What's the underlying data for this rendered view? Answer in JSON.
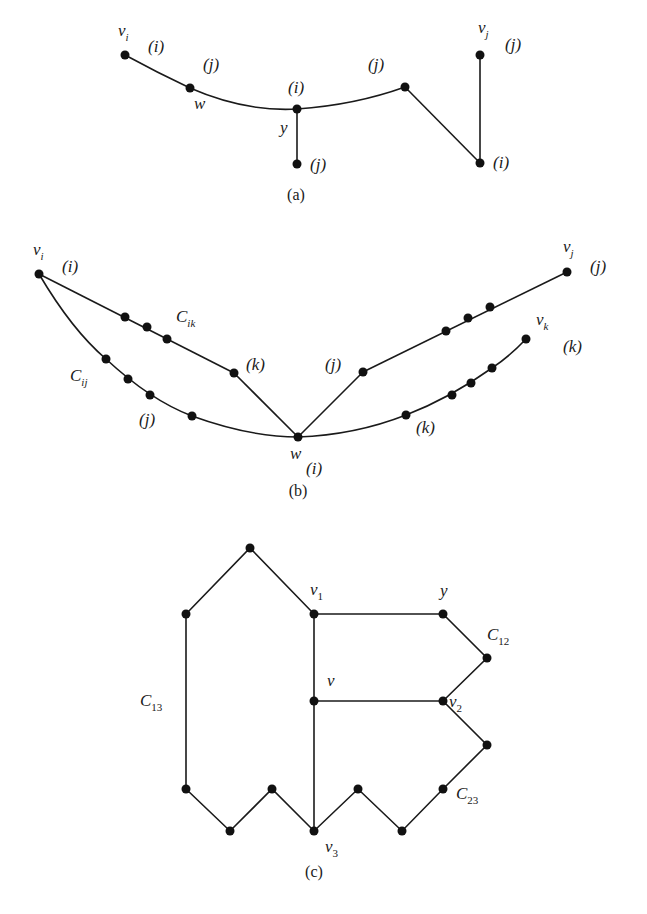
{
  "figure": {
    "style": {
      "ink": "#1a1a1a",
      "node": "#111111",
      "background": "#ffffff",
      "node_radius": 4.5
    },
    "panels": [
      {
        "id": "a",
        "caption": "(a)",
        "caption_pos": [
          296,
          200
        ],
        "nodes": [
          {
            "id": "vi",
            "x": 125,
            "y": 55
          },
          {
            "id": "w",
            "x": 190,
            "y": 88
          },
          {
            "id": "y",
            "x": 297,
            "y": 109
          },
          {
            "id": "yb",
            "x": 297,
            "y": 164
          },
          {
            "id": "pj",
            "x": 405,
            "y": 87
          },
          {
            "id": "pi",
            "x": 480,
            "y": 163
          },
          {
            "id": "vj",
            "x": 480,
            "y": 55
          }
        ],
        "edges": [
          {
            "d": "M125,55 Q158,73 190,88"
          },
          {
            "d": "M190,88 Q245,112 297,109"
          },
          {
            "d": "M297,109 Q355,105 405,87"
          },
          {
            "d": "M297,109 L297,164"
          },
          {
            "d": "M405,87 L480,163"
          },
          {
            "d": "M480,163 L480,55"
          }
        ],
        "labels": [
          {
            "text": "v",
            "sub": "i",
            "x": 118,
            "y": 36
          },
          {
            "text": "(i)",
            "x": 148,
            "y": 52,
            "size": "small"
          },
          {
            "text": "(j)",
            "x": 203,
            "y": 70
          },
          {
            "text": "w",
            "x": 194,
            "y": 109
          },
          {
            "text": "(i)",
            "x": 288,
            "y": 93,
            "size": "small"
          },
          {
            "text": "y",
            "x": 280,
            "y": 133
          },
          {
            "text": "(j)",
            "x": 310,
            "y": 170
          },
          {
            "text": "(j)",
            "x": 368,
            "y": 70
          },
          {
            "text": "v",
            "sub": "j",
            "x": 478,
            "y": 33
          },
          {
            "text": "(j)",
            "x": 505,
            "y": 50
          },
          {
            "text": "(i)",
            "x": 493,
            "y": 168,
            "size": "small"
          }
        ]
      },
      {
        "id": "b",
        "caption": "(b)",
        "caption_pos": [
          298,
          496
        ],
        "nodes": [
          {
            "id": "vi",
            "x": 39,
            "y": 274
          },
          {
            "id": "cik1",
            "x": 125,
            "y": 317
          },
          {
            "id": "cik2",
            "x": 147,
            "y": 327
          },
          {
            "id": "cik3",
            "x": 167,
            "y": 339
          },
          {
            "id": "pk",
            "x": 234,
            "y": 373
          },
          {
            "id": "cij1",
            "x": 106,
            "y": 359
          },
          {
            "id": "cij2",
            "x": 128,
            "y": 379
          },
          {
            "id": "cij3",
            "x": 150,
            "y": 395
          },
          {
            "id": "cij4",
            "x": 192,
            "y": 416
          },
          {
            "id": "w",
            "x": 298,
            "y": 437
          },
          {
            "id": "pj",
            "x": 363,
            "y": 372
          },
          {
            "id": "j1",
            "x": 446,
            "y": 331
          },
          {
            "id": "j2",
            "x": 468,
            "y": 318
          },
          {
            "id": "j3",
            "x": 490,
            "y": 307
          },
          {
            "id": "vj",
            "x": 567,
            "y": 272
          },
          {
            "id": "pk2",
            "x": 406,
            "y": 415
          },
          {
            "id": "k1",
            "x": 452,
            "y": 395
          },
          {
            "id": "k2",
            "x": 471,
            "y": 383
          },
          {
            "id": "k3",
            "x": 492,
            "y": 368
          },
          {
            "id": "vk",
            "x": 526,
            "y": 339
          }
        ],
        "edges": [
          {
            "d": "M39,274 L234,373"
          },
          {
            "d": "M234,373 L298,437"
          },
          {
            "d": "M39,274 Q72,330 106,359 Q150,400 192,416 Q250,437 298,437"
          },
          {
            "d": "M298,437 L363,372"
          },
          {
            "d": "M363,372 L567,272"
          },
          {
            "d": "M298,437 Q355,435 406,415 Q450,398 492,368 Q510,356 526,339"
          }
        ],
        "labels": [
          {
            "text": "v",
            "sub": "i",
            "x": 33,
            "y": 255
          },
          {
            "text": "(i)",
            "x": 62,
            "y": 272,
            "size": "small"
          },
          {
            "text": "C",
            "sub": "ik",
            "x": 176,
            "y": 322
          },
          {
            "text": "(k)",
            "x": 246,
            "y": 370
          },
          {
            "text": "C",
            "sub": "ij",
            "x": 70,
            "y": 381
          },
          {
            "text": "(j)",
            "x": 139,
            "y": 425
          },
          {
            "text": "w",
            "x": 290,
            "y": 459
          },
          {
            "text": "(i)",
            "x": 306,
            "y": 474,
            "size": "small"
          },
          {
            "text": "(j)",
            "x": 325,
            "y": 370
          },
          {
            "text": "(k)",
            "x": 416,
            "y": 433
          },
          {
            "text": "v",
            "sub": "j",
            "x": 563,
            "y": 252
          },
          {
            "text": "(j)",
            "x": 590,
            "y": 272
          },
          {
            "text": "v",
            "sub": "k",
            "x": 536,
            "y": 325
          },
          {
            "text": "(k)",
            "x": 563,
            "y": 352
          }
        ]
      },
      {
        "id": "c",
        "caption": "(c)",
        "caption_pos": [
          314,
          877
        ],
        "nodes": [
          {
            "id": "top",
            "x": 250,
            "y": 548
          },
          {
            "id": "tl",
            "x": 186,
            "y": 614
          },
          {
            "id": "v1",
            "x": 314,
            "y": 614
          },
          {
            "id": "y",
            "x": 443,
            "y": 614
          },
          {
            "id": "c12",
            "x": 487,
            "y": 658
          },
          {
            "id": "v",
            "x": 314,
            "y": 701
          },
          {
            "id": "v2",
            "x": 443,
            "y": 701
          },
          {
            "id": "r2",
            "x": 487,
            "y": 745
          },
          {
            "id": "c23",
            "x": 443,
            "y": 789
          },
          {
            "id": "b1",
            "x": 186,
            "y": 789
          },
          {
            "id": "b2",
            "x": 230,
            "y": 831
          },
          {
            "id": "b3",
            "x": 272,
            "y": 789
          },
          {
            "id": "v3",
            "x": 314,
            "y": 831
          },
          {
            "id": "b5",
            "x": 358,
            "y": 789
          },
          {
            "id": "b6",
            "x": 402,
            "y": 831
          }
        ],
        "edges": [
          {
            "d": "M186,789 L186,614 L250,548 L314,614"
          },
          {
            "d": "M314,614 L443,614 L487,658 L443,701"
          },
          {
            "d": "M314,614 L314,831"
          },
          {
            "d": "M314,701 L443,701"
          },
          {
            "d": "M443,701 L487,745 L443,789 L402,831 L358,789 L314,831 L272,789 L230,831 L186,789"
          }
        ],
        "labels": [
          {
            "text": "v",
            "sub": "1",
            "subnum": true,
            "x": 310,
            "y": 595
          },
          {
            "text": "y",
            "x": 440,
            "y": 596
          },
          {
            "text": "C",
            "sub": "12",
            "subnum": true,
            "x": 487,
            "y": 640
          },
          {
            "text": "C",
            "sub": "13",
            "subnum": true,
            "x": 140,
            "y": 706
          },
          {
            "text": "v",
            "x": 327,
            "y": 686
          },
          {
            "text": "v",
            "sub": "2",
            "subnum": true,
            "x": 449,
            "y": 707
          },
          {
            "text": "C",
            "sub": "23",
            "subnum": true,
            "x": 456,
            "y": 799
          },
          {
            "text": "v",
            "sub": "3",
            "subnum": true,
            "x": 325,
            "y": 852
          }
        ]
      }
    ]
  }
}
